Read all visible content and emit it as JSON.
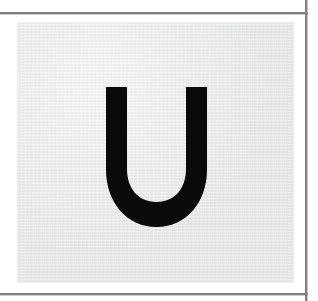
{
  "page": {
    "width": 318,
    "height": 301,
    "background_color": "#ffffff"
  },
  "rules": {
    "color": "#808080",
    "top_rule_label": "top-horizontal-rule",
    "bottom_rule_label": "bottom-horizontal-rule",
    "right_rule_label": "right-vertical-rule"
  },
  "card": {
    "background_color": "#e7e8e8",
    "texture": "paper-grain",
    "left": 17,
    "top": 22,
    "width": 277,
    "height": 261
  },
  "glyph": {
    "character": "U",
    "name": "letter-u",
    "color": "#0a0a0a",
    "style": "bold-sans-serif-uppercase",
    "alt_text": "U"
  }
}
